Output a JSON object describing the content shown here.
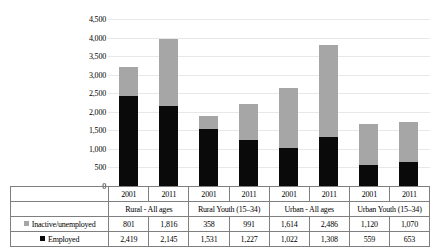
{
  "chart_data": {
    "type": "bar",
    "subtype": "stacked-column",
    "title": "",
    "xlabel": "",
    "ylabel": "",
    "ylim": [
      0,
      4500
    ],
    "ytick_step": 500,
    "grid": true,
    "legend_position": "table-left",
    "ytick_labels": [
      "4,500",
      "4,000",
      "3,500",
      "3,000",
      "2,500",
      "2,000",
      "1,500",
      "1,000",
      "500",
      "0"
    ],
    "ytick_values": [
      4500,
      4000,
      3500,
      3000,
      2500,
      2000,
      1500,
      1000,
      500,
      0
    ],
    "categories": [
      "2001",
      "2011",
      "2001",
      "2011",
      "2001",
      "2011",
      "2001",
      "2011"
    ],
    "groups": [
      {
        "label": "Rural - All ages",
        "span": 2
      },
      {
        "label": "Rural Youth (15–34)",
        "span": 2
      },
      {
        "label": "Urban - All ages",
        "span": 2
      },
      {
        "label": "Urban Youth (15–34)",
        "span": 2
      }
    ],
    "series": [
      {
        "name": "Inactive/unemployed",
        "color": "#a6a6a6",
        "stack_position": "top",
        "values": [
          801,
          1816,
          358,
          991,
          1614,
          2486,
          1120,
          1070
        ],
        "display_values": [
          "801",
          "1,816",
          "358",
          "991",
          "1,614",
          "2,486",
          "1,120",
          "1,070"
        ]
      },
      {
        "name": "Employed",
        "color": "#0a0a0a",
        "stack_position": "bottom",
        "values": [
          2419,
          2145,
          1531,
          1227,
          1022,
          1308,
          559,
          653
        ],
        "display_values": [
          "2,419",
          "2,145",
          "1,531",
          "1,227",
          "1,022",
          "1,308",
          "559",
          "653"
        ]
      }
    ],
    "totals": [
      3220,
      3961,
      1889,
      2218,
      2636,
      3794,
      1679,
      1723
    ]
  },
  "legend": {
    "items": [
      {
        "label": "Inactive/unemployed",
        "marker": "gray-square-icon"
      },
      {
        "label": "Employed",
        "marker": "black-square-icon"
      }
    ]
  }
}
